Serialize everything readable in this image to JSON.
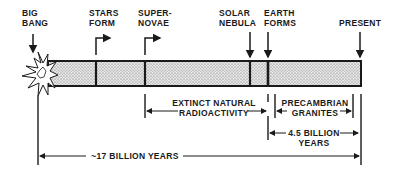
{
  "events": [
    {
      "id": "big-bang",
      "line1": "BIG",
      "line2": "BANG"
    },
    {
      "id": "stars-form",
      "line1": "STARS",
      "line2": "FORM"
    },
    {
      "id": "supernovae",
      "line1": "SUPER-",
      "line2": "NOVAE"
    },
    {
      "id": "solar-nebula",
      "line1": "SOLAR",
      "line2": "NEBULA"
    },
    {
      "id": "earth-forms",
      "line1": "EARTH",
      "line2": "FORMS"
    },
    {
      "id": "present",
      "line1": "PRESENT",
      "line2": ""
    }
  ],
  "spans": {
    "extinct": {
      "line1": "EXTINCT NATURAL",
      "line2": "RADIOACTIVITY"
    },
    "precambrian": {
      "line1": "PRECAMBRIAN",
      "line2": "GRANITES"
    },
    "earth_age": {
      "line1": "4.5 BILLION",
      "line2": "YEARS"
    },
    "universe_age": {
      "line1": "~17 BILLION YEARS"
    }
  },
  "colors": {
    "ink": "#1a1a1a",
    "stipple": "#bdbdbd",
    "background": "#ffffff"
  }
}
